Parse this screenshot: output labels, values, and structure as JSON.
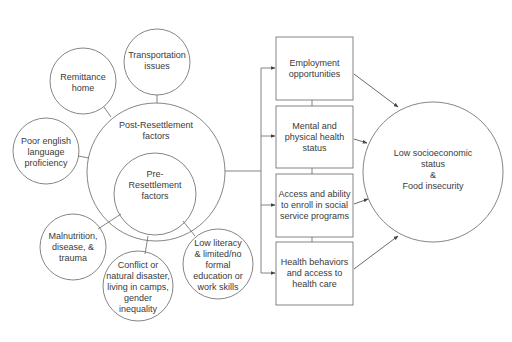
{
  "diagram": {
    "stroke_color": "#666666",
    "text_color": "#3a3a3a",
    "central": {
      "outer_label": "Post-Resettlement\nfactors",
      "inner_label": "Pre-\nResettlement\nfactors"
    },
    "post_factors": [
      {
        "label": "Transportation\nissues"
      },
      {
        "label": "Remittance\nhome"
      },
      {
        "label": "Poor english\nlanguage\nproficiency"
      }
    ],
    "pre_factors": [
      {
        "label": "Malnutrition,\ndisease, &\ntrauma"
      },
      {
        "label": "Conflict or\nnatural disaster,\nliving in camps,\ngender\ninequality"
      },
      {
        "label": "Low literacy\n& limited/no\nformal\neducation or\nwork skills"
      }
    ],
    "mediators": [
      {
        "label": "Employment\nopportunities"
      },
      {
        "label": "Mental and\nphysical health\nstatus"
      },
      {
        "label": "Access and ability\nto enroll in social\nservice programs"
      },
      {
        "label": "Health behaviors\nand access to\nhealth care"
      }
    ],
    "outcome": {
      "label": "Low socioeconomic\nstatus\n&\nFood insecurity"
    }
  }
}
